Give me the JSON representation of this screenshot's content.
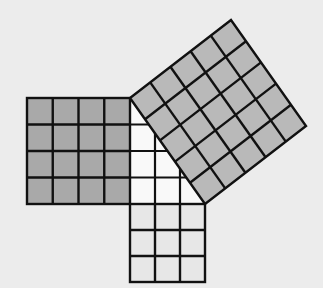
{
  "diagram": {
    "colors": {
      "background": "#ececec",
      "stroke": "#111111",
      "square_a_fill": "#a9a9a9",
      "square_b_fill": "#e7e7e7",
      "square_c_fill": "#b9b9b9",
      "triangle_fill": "#f9f9f9"
    },
    "triangle": {
      "right_angle": [
        130,
        204
      ],
      "top": [
        130,
        98
      ],
      "right": [
        205,
        204
      ],
      "legs": [
        4,
        3
      ],
      "hypotenuse": 5
    },
    "squares": [
      {
        "name": "leg-4-square",
        "side": 4,
        "cells": 16,
        "shade": "dark"
      },
      {
        "name": "leg-3-square",
        "side": 3,
        "cells": 9,
        "shade": "light"
      },
      {
        "name": "hypotenuse-5-square",
        "side": 5,
        "cells": 25,
        "shade": "medium"
      }
    ]
  }
}
